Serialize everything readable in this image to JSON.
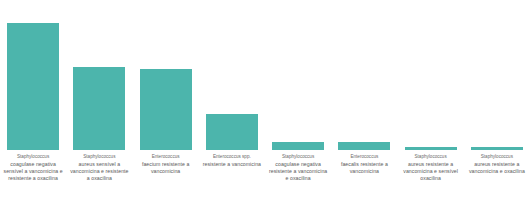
{
  "chart_data": {
    "type": "bar",
    "title": "",
    "subtitle": "",
    "xlabel": "",
    "ylabel": "",
    "grid": false,
    "legend": "none",
    "bar_color": "#4cb5ac",
    "ylim": [
      0,
      100
    ],
    "categories": [
      "Staphylococcus coagulase negativa sensível a vancomicina e resistente a oxacilina",
      "Staphylococcus aureus sensível a vancomicina e resistente a oxacilina",
      "Enterococcus faecium resistente a vancomicina",
      "Enterococcus spp. resistente a vancomicina",
      "Staphylococcus coagulase negativa resistente a vancomicina e oxacilina",
      "Enterococcus faecalis resistente a vancomicina",
      "Staphylococcus aureus resistente a vancomicina e sensível oxacilina",
      "Staphylococcus aureus resistente a vancomicina e oxacilina"
    ],
    "category_genus": [
      "Staphylococcus",
      "Staphylococcus",
      "Enterococcus",
      "Enterococcus spp.",
      "Staphylococcus",
      "Enterococcus",
      "Staphylococcus",
      "Staphylococcus"
    ],
    "category_rest": [
      "coagulase negativa sensível a vancomicina e resistente a oxacilina",
      "aureus sensível a vancomicina e resistente a oxacilina",
      "faecium resistente a vancomicina",
      "resistente a vancomicina",
      "coagulase negativa resistente a vancomicina e oxacilina",
      "faecalis resistente a vancomicina",
      "aureus resistente a vancomicina e sensível oxacilina",
      "aureus resistente a vancomicina e oxacilina"
    ],
    "values": [
      92,
      60,
      59,
      26,
      6,
      6,
      2.5,
      2
    ]
  }
}
